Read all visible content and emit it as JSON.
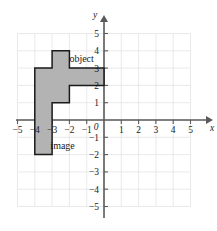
{
  "figure": {
    "kind": "coordinate-plane-figure",
    "background_color": "#ffffff",
    "axis_color": "#5a5a5a",
    "grid_color": "#e3e3e3",
    "shape_fill_color": "#b3b3b3",
    "shape_stroke_color": "#1a1a1a",
    "origin_px": {
      "x": 104,
      "y": 120
    },
    "unit_px": 17.3
  },
  "chart_data": {
    "type": "scatter",
    "title": "",
    "subtitle": "",
    "xlabel": "x",
    "ylabel": "y",
    "xlim": [
      -5,
      5
    ],
    "ylim": [
      -5,
      5
    ],
    "grid": true,
    "legend_position": "none",
    "x_tick_labels": [
      "−5",
      "−4",
      "−3",
      "−2",
      "−1",
      "1",
      "2",
      "3",
      "4",
      "5"
    ],
    "x_tick_values": [
      -5,
      -4,
      -3,
      -2,
      -1,
      1,
      2,
      3,
      4,
      5
    ],
    "y_tick_labels": [
      "5",
      "4",
      "3",
      "2",
      "1",
      "−1",
      "−2",
      "−3",
      "−4",
      "−5"
    ],
    "y_tick_values": [
      5,
      4,
      3,
      2,
      1,
      -1,
      -2,
      -3,
      -4,
      -5
    ],
    "origin_label": "0",
    "annotations": [
      {
        "text": "object",
        "x": -2.0,
        "y": 3.55
      },
      {
        "text": "image",
        "x": -3.1,
        "y": -1.45
      }
    ],
    "shapes": [
      {
        "name": "L-shaped-polygon",
        "fill": "#b3b3b3",
        "stroke": "#1a1a1a",
        "vertices": [
          [
            -3,
            4
          ],
          [
            -2,
            4
          ],
          [
            -2,
            3
          ],
          [
            0,
            3
          ],
          [
            0,
            2
          ],
          [
            -2,
            2
          ],
          [
            -2,
            1
          ],
          [
            -3,
            1
          ],
          [
            -3,
            0
          ],
          [
            -3,
            -2
          ],
          [
            -4,
            -2
          ],
          [
            -4,
            3
          ],
          [
            -3,
            3
          ]
        ]
      }
    ]
  },
  "axis_names": {
    "x": "x",
    "y": "y"
  }
}
